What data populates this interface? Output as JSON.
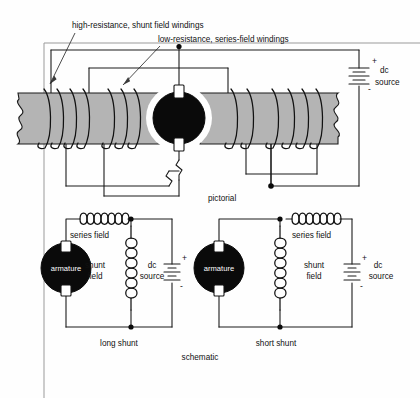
{
  "figure": {
    "annotations": [
      {
        "id": "shunt-anno",
        "text": "high-resistance, shunt field windings"
      },
      {
        "id": "series-anno",
        "text": "low-resistance, series-field windings"
      }
    ],
    "pictorial": {
      "caption": "pictorial",
      "source": {
        "label_line1": "dc",
        "label_line2": "source",
        "plus": "+",
        "minus": "-"
      }
    },
    "schematic": {
      "caption": "schematic",
      "circuits": [
        {
          "id": "long-shunt",
          "caption": "long shunt",
          "armature_label": "armature",
          "series_label": "series field",
          "shunt_label_line1": "shunt",
          "shunt_label_line2": "field",
          "source_label_line1": "dc",
          "source_label_line2": "source",
          "plus": "+",
          "minus": "-"
        },
        {
          "id": "short-shunt",
          "caption": "short shunt",
          "armature_label": "armature",
          "series_label": "series field",
          "shunt_label_line1": "shunt",
          "shunt_label_line2": "field",
          "source_label_line1": "dc",
          "source_label_line2": "source",
          "plus": "+",
          "minus": "-"
        }
      ]
    },
    "colors": {
      "pole_fill": "#b4b4b4",
      "armature_fill": "#0a0a0a",
      "wire": "#1a1a1a",
      "background": "#fefefe"
    }
  }
}
